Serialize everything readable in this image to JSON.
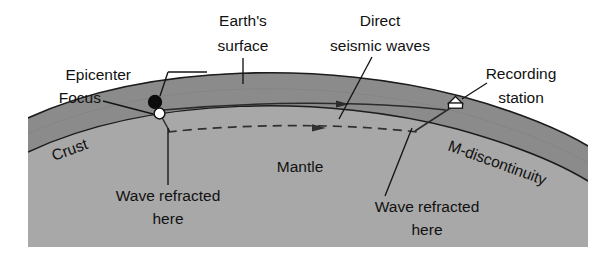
{
  "figure": {
    "background_color": "#ffffff",
    "crust_color": "#8b8b8b",
    "mantle_color": "#a8a8a8",
    "line_color": "#1c1c1c",
    "text_color": "#111111"
  },
  "labels": {
    "epicenter": "Epicenter",
    "focus": "Focus",
    "earths_surface_line1": "Earth's",
    "earths_surface_line2": "surface",
    "direct_waves_line1": "Direct",
    "direct_waves_line2": "seismic waves",
    "recording_station_line1": "Recording",
    "recording_station_line2": "station",
    "crust": "Crust",
    "mantle": "Mantle",
    "m_discontinuity": "M-discontinuity",
    "wave_refracted_left_line1": "Wave refracted",
    "wave_refracted_left_line2": "here",
    "wave_refracted_right_line1": "Wave refracted",
    "wave_refracted_right_line2": "here"
  },
  "markers": {
    "epicenter_marker": "filled-circle",
    "focus_marker": "hollow-circle",
    "recording_station_marker": "station-hut",
    "direct_wave_arrow": "arrowhead-right",
    "refracted_wave_arrow": "arrowhead-right"
  },
  "layers": [
    {
      "name": "crust",
      "label": "Crust",
      "fill": "#8b8b8b"
    },
    {
      "name": "mantle",
      "label": "Mantle",
      "fill": "#a8a8a8"
    }
  ],
  "ray_paths": [
    {
      "name": "direct-seismic-waves",
      "style": "solid",
      "from": "focus",
      "to": "recording-station"
    },
    {
      "name": "refracted-waves",
      "style": "dashed",
      "from": "focus",
      "to": "recording-station",
      "travels_along": "M-discontinuity"
    }
  ]
}
